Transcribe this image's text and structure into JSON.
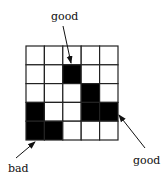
{
  "diagram": {
    "grid": {
      "rows": 5,
      "cols": 5,
      "filled_cells": [
        [
          1,
          2
        ],
        [
          2,
          3
        ],
        [
          3,
          0
        ],
        [
          3,
          3
        ],
        [
          3,
          4
        ],
        [
          4,
          0
        ],
        [
          4,
          1
        ]
      ],
      "fill_color": "#000000",
      "empty_color": "#ffffff",
      "line_color": "#222222"
    },
    "labels": {
      "top": "good",
      "bottom_left": "bad",
      "bottom_right": "good"
    }
  }
}
